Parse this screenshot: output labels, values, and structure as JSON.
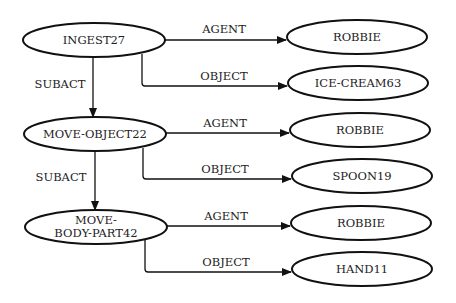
{
  "diagram": {
    "type": "conceptual-dependency-graph",
    "nodes": [
      {
        "id": "ingest",
        "label": "INGEST27",
        "lines": [
          "INGEST27"
        ],
        "cx": 94,
        "cy": 40
      },
      {
        "id": "robbie1",
        "label": "ROBBIE",
        "lines": [
          "ROBBIE"
        ],
        "cx": 357,
        "cy": 37
      },
      {
        "id": "icecream",
        "label": "ICE-CREAM63",
        "lines": [
          "ICE-CREAM63"
        ],
        "cx": 358,
        "cy": 83
      },
      {
        "id": "moveobj",
        "label": "MOVE-OBJECT22",
        "lines": [
          "MOVE-OBJECT22"
        ],
        "cx": 95,
        "cy": 134
      },
      {
        "id": "robbie2",
        "label": "ROBBIE",
        "lines": [
          "ROBBIE"
        ],
        "cx": 360,
        "cy": 130
      },
      {
        "id": "spoon",
        "label": "SPOON19",
        "lines": [
          "SPOON19"
        ],
        "cx": 362,
        "cy": 176
      },
      {
        "id": "movebody",
        "label": "MOVE-BODY-PART42",
        "lines": [
          "MOVE-",
          "BODY-PART42"
        ],
        "cx": 96,
        "cy": 227
      },
      {
        "id": "robbie3",
        "label": "ROBBIE",
        "lines": [
          "ROBBIE"
        ],
        "cx": 361,
        "cy": 223
      },
      {
        "id": "hand",
        "label": "HAND11",
        "lines": [
          "HAND11"
        ],
        "cx": 362,
        "cy": 269
      }
    ],
    "edges": [
      {
        "from": "ingest",
        "to": "robbie1",
        "label": "AGENT"
      },
      {
        "from": "ingest",
        "to": "icecream",
        "label": "OBJECT"
      },
      {
        "from": "ingest",
        "to": "moveobj",
        "label": "SUBACT"
      },
      {
        "from": "moveobj",
        "to": "robbie2",
        "label": "AGENT"
      },
      {
        "from": "moveobj",
        "to": "spoon",
        "label": "OBJECT"
      },
      {
        "from": "moveobj",
        "to": "movebody",
        "label": "SUBACT"
      },
      {
        "from": "movebody",
        "to": "robbie3",
        "label": "AGENT"
      },
      {
        "from": "movebody",
        "to": "hand",
        "label": "OBJECT"
      }
    ],
    "labels": {
      "n_ingest": "INGEST27",
      "n_robbie1": "ROBBIE",
      "n_icecream": "ICE-CREAM63",
      "n_moveobj": "MOVE-OBJECT22",
      "n_robbie2": "ROBBIE",
      "n_spoon": "SPOON19",
      "n_movebody_line1": "MOVE-",
      "n_movebody_line2": "BODY-PART42",
      "n_robbie3": "ROBBIE",
      "n_hand": "HAND11",
      "e_agent1": "AGENT",
      "e_object1": "OBJECT",
      "e_subact1": "SUBACT",
      "e_agent2": "AGENT",
      "e_object2": "OBJECT",
      "e_subact2": "SUBACT",
      "e_agent3": "AGENT",
      "e_object3": "OBJECT"
    },
    "colors": {
      "stroke": "#111111",
      "text": "#222222",
      "background": "#ffffff"
    }
  }
}
